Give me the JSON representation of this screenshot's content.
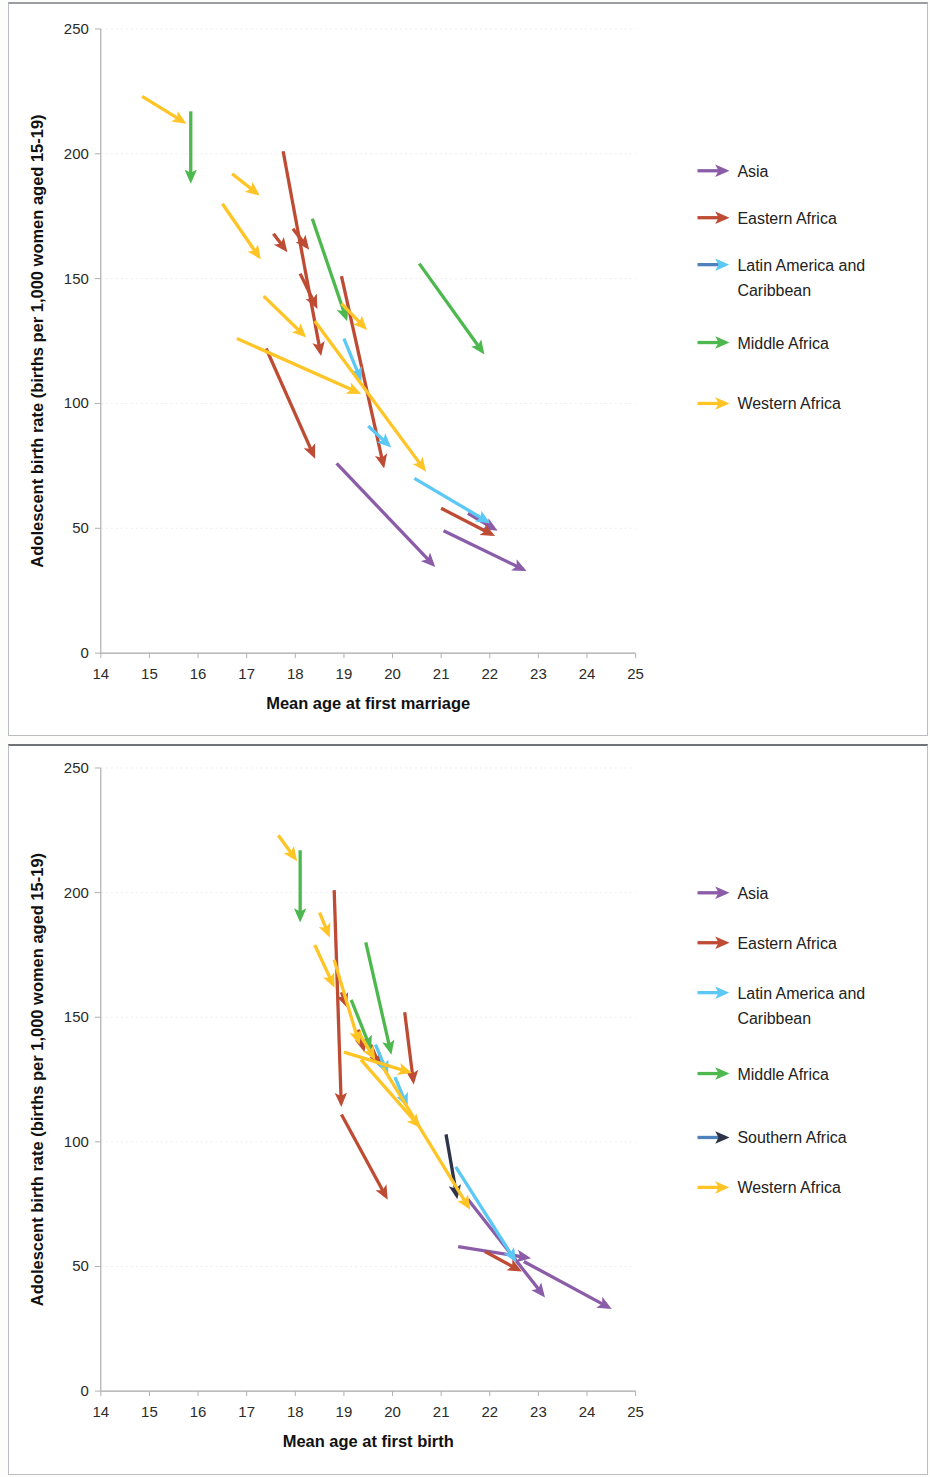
{
  "figure": {
    "panels": [
      "top",
      "bottom"
    ]
  },
  "chart_data": [
    {
      "panel": "top",
      "type": "scatter",
      "title": "",
      "xlabel": "Mean age at first marriage",
      "ylabel": "Adolescent birth rate (births per 1,000 women aged 15-19)",
      "xlim": [
        14,
        25
      ],
      "ylim": [
        0,
        250
      ],
      "xticks": [
        14,
        15,
        16,
        17,
        18,
        19,
        20,
        21,
        22,
        23,
        24,
        25
      ],
      "yticks": [
        0,
        50,
        100,
        150,
        200,
        250
      ],
      "grid": "horizontal-faint",
      "legend_position": "right",
      "legend": [
        {
          "name": "Asia",
          "color": "#8B5CA8"
        },
        {
          "name": "Eastern Africa",
          "color": "#BE4B33"
        },
        {
          "name": "Latin America and Caribbean",
          "color": "#4F81BD"
        },
        {
          "name": "Middle Africa",
          "color": "#4DB84D"
        },
        {
          "name": "Western Africa",
          "color": "#FFC425"
        }
      ],
      "series": [
        {
          "name": "Asia",
          "color": "#8B5CA8",
          "arrows": [
            {
              "x1": 18.85,
              "y1": 76,
              "x2": 20.95,
              "y2": 33
            },
            {
              "x1": 21.05,
              "y1": 49,
              "x2": 22.85,
              "y2": 32
            },
            {
              "x1": 21.55,
              "y1": 56,
              "x2": 22.25,
              "y2": 48
            }
          ]
        },
        {
          "name": "Eastern Africa",
          "color": "#BE4B33",
          "arrows": [
            {
              "x1": 17.75,
              "y1": 201,
              "x2": 18.55,
              "y2": 117
            },
            {
              "x1": 17.4,
              "y1": 122,
              "x2": 18.45,
              "y2": 76
            },
            {
              "x1": 18.95,
              "y1": 151,
              "x2": 19.85,
              "y2": 72
            },
            {
              "x1": 17.55,
              "y1": 168,
              "x2": 17.9,
              "y2": 159
            },
            {
              "x1": 17.95,
              "y1": 170,
              "x2": 18.35,
              "y2": 160
            },
            {
              "x1": 18.1,
              "y1": 152,
              "x2": 18.5,
              "y2": 136
            },
            {
              "x1": 21.0,
              "y1": 58,
              "x2": 22.2,
              "y2": 46
            }
          ]
        },
        {
          "name": "Latin America and Caribbean",
          "color": "#5BC8F5",
          "arrows": [
            {
              "x1": 19.0,
              "y1": 126,
              "x2": 19.4,
              "y2": 107
            },
            {
              "x1": 19.5,
              "y1": 91,
              "x2": 20.05,
              "y2": 81
            },
            {
              "x1": 20.45,
              "y1": 70,
              "x2": 22.1,
              "y2": 51
            }
          ]
        },
        {
          "name": "Middle Africa",
          "color": "#4DB84D",
          "arrows": [
            {
              "x1": 15.85,
              "y1": 217,
              "x2": 15.85,
              "y2": 186
            },
            {
              "x1": 18.35,
              "y1": 174,
              "x2": 19.1,
              "y2": 131
            },
            {
              "x1": 20.55,
              "y1": 156,
              "x2": 21.95,
              "y2": 118
            }
          ]
        },
        {
          "name": "Western Africa",
          "color": "#FFC425",
          "arrows": [
            {
              "x1": 14.85,
              "y1": 223,
              "x2": 15.85,
              "y2": 211
            },
            {
              "x1": 16.7,
              "y1": 192,
              "x2": 17.35,
              "y2": 182
            },
            {
              "x1": 16.5,
              "y1": 180,
              "x2": 17.35,
              "y2": 156
            },
            {
              "x1": 17.35,
              "y1": 143,
              "x2": 18.3,
              "y2": 125
            },
            {
              "x1": 16.8,
              "y1": 126,
              "x2": 19.45,
              "y2": 103
            },
            {
              "x1": 18.95,
              "y1": 140,
              "x2": 19.55,
              "y2": 128
            },
            {
              "x1": 18.4,
              "y1": 133,
              "x2": 20.75,
              "y2": 71
            }
          ]
        }
      ]
    },
    {
      "panel": "bottom",
      "type": "scatter",
      "title": "",
      "xlabel": "Mean age at first birth",
      "ylabel": "Adolescent birth rate (births per 1,000 women aged 15-19)",
      "xlim": [
        14,
        25
      ],
      "ylim": [
        0,
        250
      ],
      "xticks": [
        14,
        15,
        16,
        17,
        18,
        19,
        20,
        21,
        22,
        23,
        24,
        25
      ],
      "yticks": [
        0,
        50,
        100,
        150,
        200,
        250
      ],
      "grid": "horizontal-faint",
      "legend_position": "right",
      "legend": [
        {
          "name": "Asia",
          "color": "#8B5CA8"
        },
        {
          "name": "Eastern Africa",
          "color": "#BE4B33"
        },
        {
          "name": "Latin America and Caribbean",
          "color": "#5BC8F5"
        },
        {
          "name": "Middle Africa",
          "color": "#4DB84D"
        },
        {
          "name": "Southern Africa",
          "color": "#4F81BD"
        },
        {
          "name": "Western Africa",
          "color": "#FFC425"
        }
      ],
      "series": [
        {
          "name": "Asia",
          "color": "#8B5CA8",
          "arrows": [
            {
              "x1": 21.55,
              "y1": 77,
              "x2": 23.2,
              "y2": 36
            },
            {
              "x1": 22.7,
              "y1": 52,
              "x2": 24.6,
              "y2": 32
            },
            {
              "x1": 21.35,
              "y1": 58,
              "x2": 22.95,
              "y2": 53
            }
          ]
        },
        {
          "name": "Eastern Africa",
          "color": "#BE4B33",
          "arrows": [
            {
              "x1": 18.8,
              "y1": 201,
              "x2": 18.95,
              "y2": 112
            },
            {
              "x1": 18.95,
              "y1": 160,
              "x2": 19.1,
              "y2": 152
            },
            {
              "x1": 19.3,
              "y1": 145,
              "x2": 19.45,
              "y2": 134
            },
            {
              "x1": 18.95,
              "y1": 111,
              "x2": 19.95,
              "y2": 75
            },
            {
              "x1": 20.25,
              "y1": 152,
              "x2": 20.45,
              "y2": 121
            },
            {
              "x1": 19.55,
              "y1": 139,
              "x2": 19.8,
              "y2": 128
            },
            {
              "x1": 21.9,
              "y1": 56,
              "x2": 22.75,
              "y2": 47
            }
          ]
        },
        {
          "name": "Latin America and Caribbean",
          "color": "#5BC8F5",
          "arrows": [
            {
              "x1": 19.65,
              "y1": 139,
              "x2": 19.95,
              "y2": 125
            },
            {
              "x1": 20.05,
              "y1": 126,
              "x2": 20.35,
              "y2": 112
            },
            {
              "x1": 21.3,
              "y1": 90,
              "x2": 22.6,
              "y2": 50
            }
          ]
        },
        {
          "name": "Middle Africa",
          "color": "#4DB84D",
          "arrows": [
            {
              "x1": 18.1,
              "y1": 217,
              "x2": 18.1,
              "y2": 186
            },
            {
              "x1": 19.45,
              "y1": 180,
              "x2": 20.0,
              "y2": 133
            },
            {
              "x1": 19.15,
              "y1": 157,
              "x2": 19.6,
              "y2": 135
            }
          ]
        },
        {
          "name": "Southern Africa",
          "color": "#2E3348",
          "arrows": [
            {
              "x1": 21.1,
              "y1": 103,
              "x2": 21.35,
              "y2": 75
            }
          ]
        },
        {
          "name": "Western Africa",
          "color": "#FFC425",
          "arrows": [
            {
              "x1": 17.65,
              "y1": 223,
              "x2": 18.1,
              "y2": 211
            },
            {
              "x1": 18.5,
              "y1": 192,
              "x2": 18.75,
              "y2": 180
            },
            {
              "x1": 18.4,
              "y1": 179,
              "x2": 18.85,
              "y2": 160
            },
            {
              "x1": 18.8,
              "y1": 173,
              "x2": 19.35,
              "y2": 137
            },
            {
              "x1": 19.3,
              "y1": 144,
              "x2": 19.7,
              "y2": 131
            },
            {
              "x1": 19.0,
              "y1": 136,
              "x2": 20.5,
              "y2": 127
            },
            {
              "x1": 19.35,
              "y1": 133,
              "x2": 20.65,
              "y2": 104
            },
            {
              "x1": 19.8,
              "y1": 130,
              "x2": 21.65,
              "y2": 71
            }
          ]
        }
      ]
    }
  ]
}
